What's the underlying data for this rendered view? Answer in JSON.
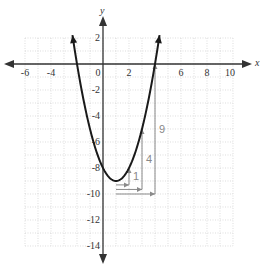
{
  "chart_data": {
    "type": "line",
    "title": "",
    "xlabel": "x",
    "ylabel": "y",
    "xlim": [
      -6,
      10
    ],
    "ylim": [
      -14,
      2
    ],
    "grid": true,
    "x_ticks": [
      "-6",
      "-4",
      "0",
      "2",
      "6",
      "8",
      "10"
    ],
    "y_ticks": [
      "2",
      "-2",
      "-4",
      "-6",
      "-8",
      "-10",
      "-12",
      "-14"
    ],
    "series": [
      {
        "name": "parabola",
        "equation": "y = x^2 - 2x - 8",
        "x": [
          -2.2,
          -2,
          -1,
          0,
          1,
          2,
          3,
          4,
          4.2
        ],
        "values": [
          0.44,
          0,
          -5,
          -8,
          -9,
          -8,
          -5,
          0,
          0.44
        ]
      }
    ],
    "vertex": [
      1,
      -9
    ],
    "annotations": [
      {
        "label": "1",
        "step_right": 1,
        "step_up": 1
      },
      {
        "label": "4",
        "step_right": 2,
        "step_up": 4
      },
      {
        "label": "9",
        "step_right": 3,
        "step_up": 9
      }
    ],
    "colors": {
      "curve": "#1a1a1a",
      "axis": "#333333",
      "grid": "#c8c8c8",
      "annotation": "#8a8a8a"
    }
  }
}
